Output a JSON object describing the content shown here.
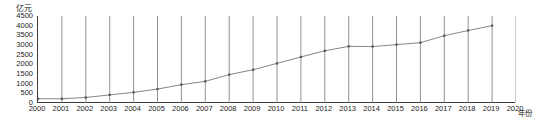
{
  "chart_data": {
    "type": "line",
    "title": "",
    "subtitle": "",
    "xlabel": "年份",
    "ylabel": "亿元",
    "xlim": [
      2000,
      2020
    ],
    "ylim": [
      0,
      4500
    ],
    "ytick_interval": 500,
    "grid": "vertical-only",
    "legend": "none",
    "marker": "square",
    "line_color": "#777777",
    "marker_color": "#555555",
    "axis_color": "#3a3a3a",
    "gridline_color": "#888888",
    "categories": [
      "2000",
      "2001",
      "2002",
      "2003",
      "2004",
      "2005",
      "2006",
      "2007",
      "2008",
      "2009",
      "2010",
      "2011",
      "2012",
      "2013",
      "2014",
      "2015",
      "2016",
      "2017",
      "2018",
      "2019",
      "2020"
    ],
    "yticks": [
      0,
      500,
      1000,
      1500,
      2000,
      2500,
      3000,
      3500,
      4000,
      4500
    ],
    "series": [
      {
        "name": "亿元",
        "x": [
          2000,
          2001,
          2002,
          2003,
          2004,
          2005,
          2006,
          2007,
          2008,
          2009,
          2010,
          2011,
          2012,
          2013,
          2014,
          2015,
          2016,
          2017,
          2018,
          2019
        ],
        "values": [
          220,
          220,
          285,
          420,
          550,
          720,
          950,
          1120,
          1470,
          1720,
          2050,
          2380,
          2700,
          2930,
          2920,
          3020,
          3120,
          3480,
          3750,
          4000
        ]
      }
    ],
    "annotations": []
  }
}
